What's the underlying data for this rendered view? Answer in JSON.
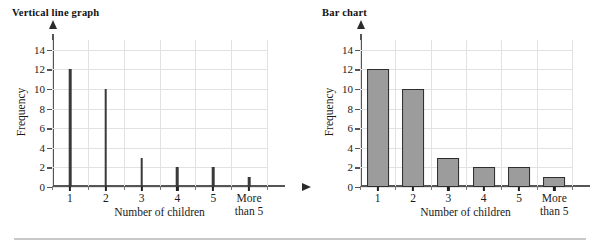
{
  "figure": {
    "bottom_rule": true,
    "background_color": "#ffffff"
  },
  "charts": [
    {
      "title": "Vertical line graph",
      "xlabel": "Number of children",
      "ylabel": "Frequency"
    },
    {
      "title": "Bar chart",
      "xlabel": "Number of children",
      "ylabel": "Frequency"
    }
  ],
  "chart_data": [
    {
      "type": "bar",
      "style": "vertical-line-graph",
      "title": "Vertical line graph",
      "xlabel": "Number of children",
      "ylabel": "Frequency",
      "categories": [
        "1",
        "2",
        "3",
        "4",
        "5",
        "More\nthan 5"
      ],
      "category_labels": [
        "1",
        "2",
        "3",
        "4",
        "5",
        "More than 5"
      ],
      "values": [
        12,
        10,
        3,
        2,
        2,
        1
      ],
      "ylim": [
        0,
        15
      ],
      "yticks": [
        0,
        2,
        4,
        6,
        8,
        10,
        12,
        14
      ],
      "ytick_labels": [
        "0",
        "2",
        "4",
        "6",
        "8",
        "10",
        "12",
        "14"
      ],
      "grid": true,
      "grid_color": "#e2e2e2",
      "legend": "none",
      "mark_color": "#3a3a3a",
      "axis_arrows": true
    },
    {
      "type": "bar",
      "style": "bar-chart",
      "title": "Bar chart",
      "xlabel": "Number of children",
      "ylabel": "Frequency",
      "categories": [
        "1",
        "2",
        "3",
        "4",
        "5",
        "More\nthan 5"
      ],
      "category_labels": [
        "1",
        "2",
        "3",
        "4",
        "5",
        "More than 5"
      ],
      "values": [
        12,
        10,
        3,
        2,
        2,
        1
      ],
      "ylim": [
        0,
        15
      ],
      "yticks": [
        0,
        2,
        4,
        6,
        8,
        10,
        12,
        14
      ],
      "ytick_labels": [
        "0",
        "2",
        "4",
        "6",
        "8",
        "10",
        "12",
        "14"
      ],
      "grid": true,
      "grid_color": "#e2e2e2",
      "legend": "none",
      "bar_fill": "#9c9c9c",
      "bar_edge": "#2e2e2e",
      "axis_arrows": true
    }
  ]
}
